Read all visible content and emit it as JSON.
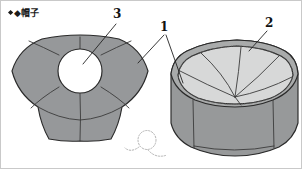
{
  "figure": {
    "caption": "◆帽子",
    "caption_marker": "◆",
    "background_color": "#ffffff",
    "border_color": "#c9c9c9"
  },
  "reference_labels": [
    {
      "id": "label-1",
      "text": "1",
      "x": 163,
      "y": 26,
      "target": "seam-lines"
    },
    {
      "id": "label-2",
      "text": "2",
      "x": 268,
      "y": 22,
      "target": "crown-rim"
    },
    {
      "id": "label-3",
      "text": "3",
      "x": 116,
      "y": 14,
      "target": "center-opening"
    }
  ],
  "views": {
    "flat": {
      "name": "flat-top-view",
      "fill_color": "#96989a",
      "outline_color": "#2a2a2a",
      "panel_count": 6,
      "opening": {
        "name": "center-opening",
        "fill_color": "#ffffff",
        "cx": 79,
        "cy": 70,
        "r": 22
      }
    },
    "perspective": {
      "name": "perspective-view",
      "top_fill_color": "#d7d8d8",
      "band_fill_color": "#97999a",
      "rim_fill_color": "#a9abab",
      "stitch_color": "#5a5a5a",
      "panel_count": 6
    },
    "ghost_detail": {
      "name": "ghost-loop-detail",
      "color": "#b4b4b4",
      "style": "dotted"
    }
  }
}
